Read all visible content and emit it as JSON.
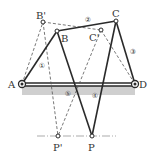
{
  "diagram": {
    "type": "four-bar linkage",
    "points": {
      "A": {
        "label": "A",
        "x": 22,
        "y": 84
      },
      "D": {
        "label": "D",
        "x": 135,
        "y": 84
      },
      "B": {
        "label": "B",
        "x": 57,
        "y": 31
      },
      "C": {
        "label": "C",
        "x": 116,
        "y": 21
      },
      "B_prime": {
        "label": "B'",
        "x": 43,
        "y": 22
      },
      "C_prime": {
        "label": "C'",
        "x": 101,
        "y": 30
      },
      "P": {
        "label": "P",
        "x": 92,
        "y": 136
      },
      "P_prime": {
        "label": "P'",
        "x": 58,
        "y": 136
      }
    },
    "links": {
      "l1": {
        "label": "①"
      },
      "l2": {
        "label": "②"
      },
      "l3": {
        "label": "③"
      },
      "l4": {
        "label": "④"
      },
      "l5": {
        "label": "⑤"
      }
    },
    "colors": {
      "line": "#2a2a2a",
      "dashed": "#555555",
      "ground": "#c8c8c8"
    }
  }
}
